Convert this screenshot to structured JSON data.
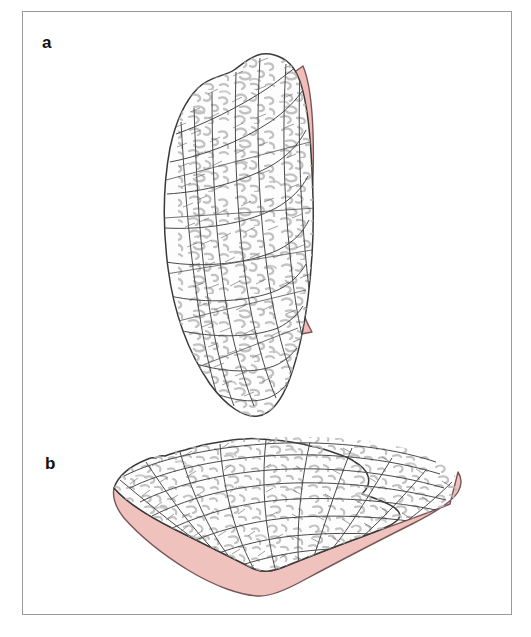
{
  "figure": {
    "type": "scientific-illustration",
    "background_color": "#ffffff",
    "frame_color": "#9a9a9a",
    "panels": [
      {
        "id": "a",
        "label": "a",
        "description": "Elongate oblique view of a shell valve with radial and concentric growth lines and a pink-shaded margin along the right edge",
        "outline_color": "#3a3a3a",
        "interior_color": "#fcfcfc",
        "margin_color": "#f2bdb8",
        "margin_outline_color": "#7a5558",
        "texture_color": "#b5b5b5",
        "grid_color": "#4a4a4a"
      },
      {
        "id": "b",
        "label": "b",
        "description": "Fan-shaped view of the same shell valve with a crenulated upper margin, radial and concentric ribbing, and a pink-shaded basal band",
        "outline_color": "#3a3a3a",
        "interior_color": "#fcfcfc",
        "margin_color": "#f0c2bd",
        "margin_outline_color": "#7a5558",
        "texture_color": "#b5b5b5",
        "grid_color": "#4a4a4a"
      }
    ]
  },
  "colors": {
    "pink_fill": "#f2bdb8",
    "pink_fill_b": "#f0c2bd",
    "pink_outline": "#7a5558",
    "ink": "#3a3a3a",
    "pencil": "#b5b5b5",
    "frame": "#9a9a9a",
    "label_text": "#111111",
    "page_background": "#ffffff"
  }
}
